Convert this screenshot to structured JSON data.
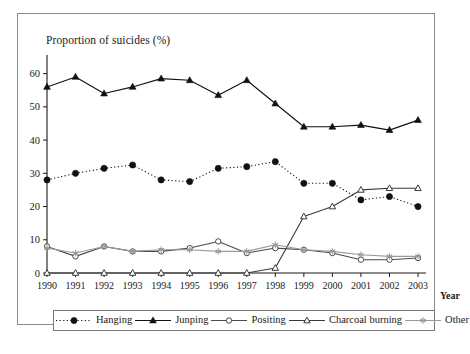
{
  "figure": {
    "y_axis_title": "Proportion of suicides (%)",
    "x_axis_name": "Year"
  },
  "chart_data": {
    "type": "line",
    "title": "Proportion of suicides (%)",
    "xlabel": "Year",
    "ylabel": "Proportion of suicides (%)",
    "xlim": [
      1990,
      2003
    ],
    "ylim": [
      0,
      65
    ],
    "yticks": [
      0,
      10,
      20,
      30,
      40,
      50,
      60
    ],
    "grid": false,
    "legend_position": "bottom",
    "categories": [
      "1990",
      "1991",
      "1992",
      "1993",
      "1994",
      "1995",
      "1996",
      "1997",
      "1998",
      "1999",
      "2000",
      "2001",
      "2002",
      "2003"
    ],
    "series": [
      {
        "name": "Hanging",
        "marker": "filled-circle",
        "line_style": "dotted",
        "color": "#111111",
        "values": [
          28,
          30,
          31.5,
          32.5,
          28,
          27.5,
          31.5,
          32,
          33.5,
          27,
          27,
          22,
          23,
          20
        ]
      },
      {
        "name": "Junping",
        "marker": "filled-triangle",
        "line_style": "solid",
        "color": "#111111",
        "values": [
          56,
          59,
          54,
          56,
          58.5,
          58,
          53.5,
          58,
          51,
          44,
          44,
          44.5,
          43,
          46
        ]
      },
      {
        "name": "Positing",
        "marker": "open-circle",
        "line_style": "solid",
        "color": "#4a4a4a",
        "values": [
          8,
          5,
          8,
          6.5,
          6.5,
          7.5,
          9.5,
          6,
          7.5,
          7,
          6,
          4,
          4,
          4.5
        ]
      },
      {
        "name": "Charcoal burning",
        "marker": "open-triangle",
        "line_style": "solid",
        "color": "#3a3a3a",
        "values": [
          0,
          0,
          0,
          0,
          0,
          0,
          0,
          0,
          1.5,
          17,
          20,
          25,
          25.5,
          25.5
        ]
      },
      {
        "name": "Other",
        "marker": "asterisk",
        "line_style": "solid",
        "color": "#9a9a9a",
        "values": [
          7.5,
          6,
          8,
          6.5,
          7,
          7,
          6.5,
          6.5,
          8.5,
          7,
          6.5,
          5.5,
          5,
          5
        ]
      }
    ]
  },
  "legend": {
    "items": [
      {
        "label": "Hanging"
      },
      {
        "label": "Junping"
      },
      {
        "label": "Positing"
      },
      {
        "label": "Charcoal burning"
      },
      {
        "label": "Other"
      }
    ]
  }
}
